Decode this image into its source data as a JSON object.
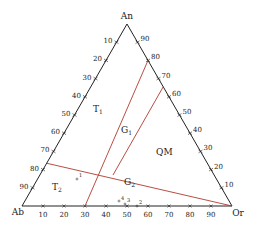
{
  "vertices": {
    "top": "An",
    "left": "Ab",
    "right": "Or"
  },
  "ticks": [
    10,
    20,
    30,
    40,
    50,
    60,
    70,
    80,
    90
  ],
  "fields": [
    {
      "id": "T1",
      "label": "T",
      "sub": "1"
    },
    {
      "id": "G1",
      "label": "G",
      "sub": "1"
    },
    {
      "id": "QM",
      "label": "QM",
      "sub": ""
    },
    {
      "id": "T2",
      "label": "T",
      "sub": "2"
    },
    {
      "id": "G2",
      "label": "G",
      "sub": "2"
    }
  ],
  "points": [
    {
      "label": "1"
    },
    {
      "label": "2"
    },
    {
      "label": "3"
    },
    {
      "label": "4"
    }
  ],
  "colors": {
    "axis": "#222222",
    "boundary": "#b03a2e"
  }
}
